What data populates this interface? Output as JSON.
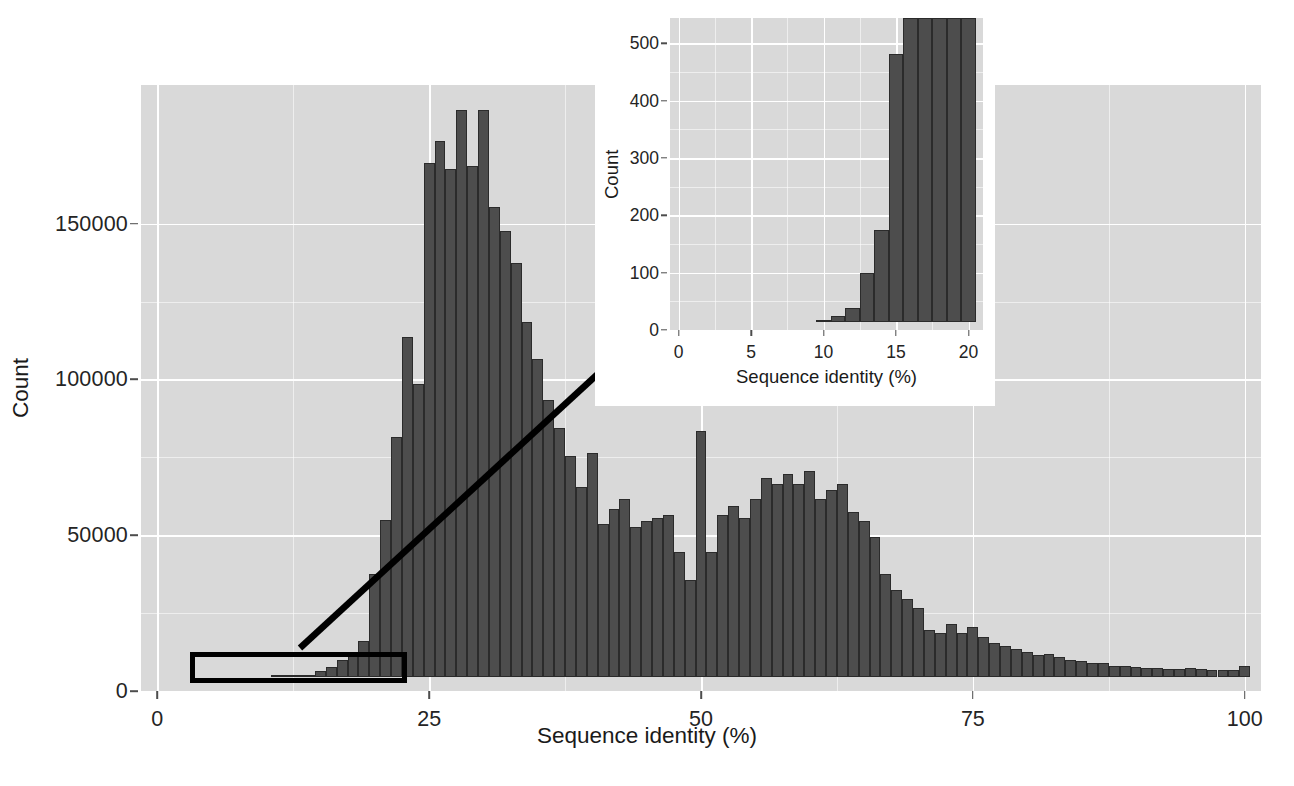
{
  "chart_data": [
    {
      "id": "main",
      "type": "bar",
      "title": "",
      "xlabel": "Sequence identity (%)",
      "ylabel": "Count",
      "xlim": [
        -1.5,
        101.5
      ],
      "ylim": [
        0,
        190000
      ],
      "xticks": [
        0,
        25,
        50,
        75,
        100
      ],
      "xtick_labels": [
        "0",
        "25",
        "50",
        "75",
        "100"
      ],
      "yticks": [
        0,
        50000,
        100000,
        150000
      ],
      "ytick_labels": [
        "0",
        "50000",
        "100000",
        "150000"
      ],
      "grid": true,
      "binwidth": 1,
      "bar_color": "#4d4d4d",
      "bar_outline": "#2b2b2b",
      "panel_color": "#d9d9d9",
      "grid_color": "#ffffff",
      "x": [
        0,
        1,
        2,
        3,
        4,
        5,
        6,
        7,
        8,
        9,
        10,
        11,
        12,
        13,
        14,
        15,
        16,
        17,
        18,
        19,
        20,
        21,
        22,
        23,
        24,
        25,
        26,
        27,
        28,
        29,
        30,
        31,
        32,
        33,
        34,
        35,
        36,
        37,
        38,
        39,
        40,
        41,
        42,
        43,
        44,
        45,
        46,
        47,
        48,
        49,
        50,
        51,
        52,
        53,
        54,
        55,
        56,
        57,
        58,
        59,
        60,
        61,
        62,
        63,
        64,
        65,
        66,
        67,
        68,
        69,
        70,
        71,
        72,
        73,
        74,
        75,
        76,
        77,
        78,
        79,
        80,
        81,
        82,
        83,
        84,
        85,
        86,
        87,
        88,
        89,
        90,
        91,
        92,
        93,
        94,
        95,
        96,
        97,
        98,
        99,
        100
      ],
      "values": [
        0,
        0,
        0,
        0,
        0,
        0,
        0,
        0,
        0,
        0,
        0,
        20,
        60,
        200,
        700,
        1800,
        3300,
        5500,
        8000,
        11500,
        33000,
        50500,
        77000,
        109000,
        94000,
        165000,
        172000,
        163000,
        182000,
        164000,
        182000,
        151000,
        143000,
        133000,
        114000,
        102000,
        89000,
        80000,
        71000,
        61000,
        72000,
        49000,
        54000,
        57000,
        48000,
        50000,
        51000,
        52000,
        40000,
        31000,
        79000,
        40000,
        52000,
        55000,
        51000,
        57000,
        64000,
        62000,
        65000,
        62000,
        66000,
        57000,
        60000,
        62000,
        53000,
        50000,
        45000,
        33000,
        28000,
        25000,
        22000,
        15000,
        14000,
        17000,
        14000,
        16000,
        13000,
        11000,
        10000,
        9000,
        8000,
        7000,
        7500,
        6500,
        5500,
        5000,
        4500,
        4500,
        3500,
        3400,
        3200,
        3000,
        2800,
        2700,
        2600,
        3000,
        2600,
        2300,
        2200,
        2100,
        3500,
        15500
      ]
    },
    {
      "id": "inset",
      "type": "bar",
      "title": "",
      "xlabel": "Sequence identity (%)",
      "ylabel": "Count",
      "xlim": [
        -0.6,
        21
      ],
      "ylim": [
        0,
        530
      ],
      "xticks": [
        0,
        5,
        10,
        15,
        20
      ],
      "xtick_labels": [
        "0",
        "5",
        "10",
        "15",
        "20"
      ],
      "yticks": [
        0,
        100,
        200,
        300,
        400,
        500
      ],
      "ytick_labels": [
        "0",
        "100",
        "200",
        "300",
        "400",
        "500"
      ],
      "grid": true,
      "binwidth": 1,
      "bar_color": "#4d4d4d",
      "bar_outline": "#2b2b2b",
      "panel_color": "#d9d9d9",
      "grid_color": "#ffffff",
      "note": "bars beyond 16% are clipped at the top of the panel",
      "x": [
        0,
        1,
        2,
        3,
        4,
        5,
        6,
        7,
        8,
        9,
        10,
        11,
        12,
        13,
        14,
        15,
        16,
        17,
        18,
        19,
        20
      ],
      "values": [
        0,
        0,
        0,
        0,
        0,
        0,
        0,
        0,
        0,
        0,
        3,
        10,
        25,
        85,
        160,
        468,
        560,
        600,
        640,
        680,
        700
      ]
    }
  ],
  "annotations": {
    "highlight_rect_label": "low-identity region",
    "arrow_label": "zoom-callout-arrow"
  }
}
